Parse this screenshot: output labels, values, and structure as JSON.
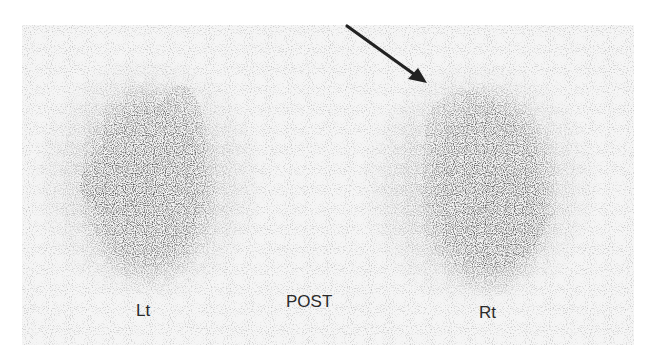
{
  "image": {
    "description": "Renal scintigraphy, posterior view, two kidneys with arrow indicating upper pole of right kidney",
    "view_label": "POST",
    "left_label": "Lt",
    "right_label": "Rt",
    "annotation": "arrow-pointing-to-upper-pole-right-kidney"
  },
  "colors": {
    "background": "#ffffff",
    "field": "#f4f4f4",
    "uptake_dark": "#3a3a3a",
    "label": "#2a2a2a",
    "arrow": "#222222"
  }
}
